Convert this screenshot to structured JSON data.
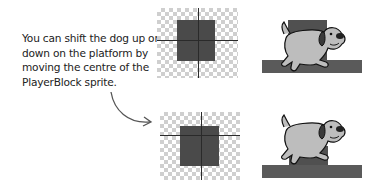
{
  "caption": "You can shift the dog up or down on the platform by moving the centre of the PlayerBlock sprite.",
  "panels": [
    {
      "id": "before",
      "sprite": "PlayerBlock",
      "crosshair": "centre-middle",
      "scene": "dog-on-platform"
    },
    {
      "id": "after",
      "sprite": "PlayerBlock",
      "crosshair": "centre-upper",
      "scene": "dog-lowered-on-platform"
    }
  ],
  "icons": {
    "arrow": "curved-arrow-icon",
    "dog": "dog-sprite-icon",
    "checker": "transparent-canvas"
  },
  "colors": {
    "sprite_fill": "#4a4a4a",
    "platform": "#5a5a5a",
    "checker_gray": "#cfcfcf",
    "dog_body": "#bdbdbd",
    "text": "#222222"
  }
}
